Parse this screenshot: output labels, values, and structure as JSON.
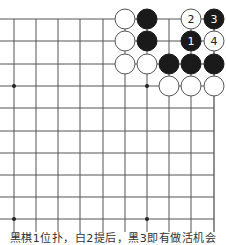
{
  "diagram": {
    "type": "go-board-fragment",
    "grid": {
      "x_lines": [
        14,
        36,
        58,
        80,
        103,
        125,
        147,
        169,
        191,
        214
      ],
      "y_lines": [
        19,
        41,
        64,
        86,
        108,
        131,
        153,
        175,
        197,
        219
      ],
      "x_extend_left": 0,
      "line_color": "#555555",
      "right_edge_is_border": true
    },
    "star_points": [
      {
        "x": 14,
        "y": 86
      },
      {
        "x": 147,
        "y": 86
      },
      {
        "x": 14,
        "y": 219
      },
      {
        "x": 147,
        "y": 219
      }
    ],
    "stones": [
      {
        "col": 125,
        "row": 19,
        "color": "white",
        "label": ""
      },
      {
        "col": 147,
        "row": 19,
        "color": "black",
        "label": ""
      },
      {
        "col": 191,
        "row": 19,
        "color": "white",
        "label": "2"
      },
      {
        "col": 214,
        "row": 19,
        "color": "black",
        "label": "3"
      },
      {
        "col": 125,
        "row": 41,
        "color": "white",
        "label": ""
      },
      {
        "col": 147,
        "row": 41,
        "color": "black",
        "label": ""
      },
      {
        "col": 191,
        "row": 41,
        "color": "black",
        "label": "1"
      },
      {
        "col": 214,
        "row": 41,
        "color": "white",
        "label": "4"
      },
      {
        "col": 125,
        "row": 64,
        "color": "white",
        "label": ""
      },
      {
        "col": 147,
        "row": 64,
        "color": "white",
        "label": ""
      },
      {
        "col": 169,
        "row": 64,
        "color": "black",
        "label": ""
      },
      {
        "col": 191,
        "row": 64,
        "color": "black",
        "label": ""
      },
      {
        "col": 214,
        "row": 64,
        "color": "black",
        "label": ""
      },
      {
        "col": 169,
        "row": 86,
        "color": "white",
        "label": ""
      },
      {
        "col": 191,
        "row": 86,
        "color": "white",
        "label": ""
      },
      {
        "col": 214,
        "row": 86,
        "color": "white",
        "label": ""
      }
    ],
    "stone_radius": 10,
    "colors": {
      "black_stone": "#1a1a1a",
      "white_stone": "#ffffff",
      "stone_outline": "#555555"
    }
  },
  "caption": "黑棋1位扑，白2提后，黑3即有做活机会"
}
